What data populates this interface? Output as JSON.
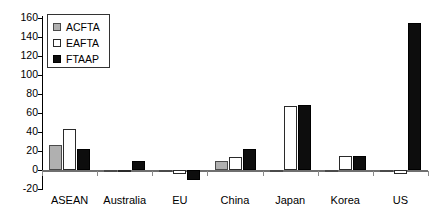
{
  "chart_data": {
    "type": "bar",
    "title": "",
    "xlabel": "",
    "ylabel": "",
    "ylim": [
      -20,
      160
    ],
    "ytick_step": 20,
    "yticks": [
      160,
      140,
      120,
      100,
      80,
      60,
      40,
      20,
      0,
      -20
    ],
    "ytick_labels": [
      "160",
      "140",
      "120",
      "100",
      "80",
      "60",
      "40",
      "20",
      "0",
      "-20"
    ],
    "grid": false,
    "legend_position": "upper-left",
    "categories": [
      "ASEAN",
      "Australia",
      "EU",
      "China",
      "Japan",
      "Korea",
      "US"
    ],
    "series": [
      {
        "name": "ACFTA",
        "color": "#b0b0b0",
        "values": [
          26,
          0,
          0,
          10,
          -2,
          0,
          -2
        ]
      },
      {
        "name": "EAFTA",
        "color": "#ffffff",
        "values": [
          43,
          0,
          -4,
          14,
          67,
          15,
          -4
        ]
      },
      {
        "name": "FTAAP",
        "color": "#0d0d0d",
        "values": [
          22,
          10,
          -10,
          22,
          68,
          15,
          155
        ]
      }
    ]
  },
  "legend": {
    "entries": [
      {
        "label": "ACFTA",
        "swatch": "gray-swatch"
      },
      {
        "label": "EAFTA",
        "swatch": "white-swatch"
      },
      {
        "label": "FTAAP",
        "swatch": "black-swatch"
      }
    ]
  }
}
